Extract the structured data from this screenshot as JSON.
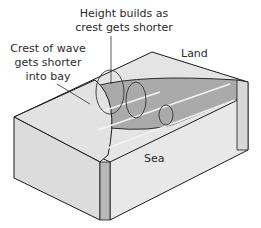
{
  "labels": {
    "height": [
      "Height builds as",
      "crest gets shorter"
    ],
    "crest": [
      "Crest of wave",
      "gets shorter",
      "into bay"
    ],
    "land": "Land",
    "sea": "Sea"
  },
  "colors": {
    "land_top": "#e4e4e4",
    "bay_water": "#aaaaaa",
    "sea_top": "#e6e6e6",
    "side_face": "#dcdcdc",
    "front_face": "#e8e8e8",
    "outline": "#1a1a1a",
    "wave_arrow": "#f2f2f2"
  }
}
